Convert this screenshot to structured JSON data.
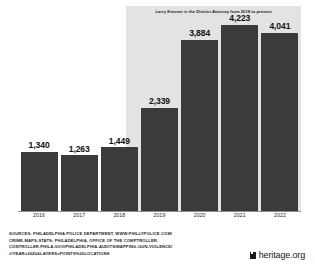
{
  "chart_data": {
    "type": "bar",
    "title": "",
    "subtitle": "",
    "xlabel": "",
    "ylabel": "",
    "categories": [
      "2016",
      "2017",
      "2018",
      "2019",
      "2020",
      "2021",
      "2022"
    ],
    "values": [
      1340,
      1263,
      1449,
      2339,
      3884,
      4223,
      4041
    ],
    "value_labels": [
      "1,340",
      "1,263",
      "1,449",
      "2,339",
      "3,884",
      "4,223",
      "4,041"
    ],
    "ylim": [
      0,
      4650
    ],
    "grid": false,
    "legend": null,
    "bar_color": "#3b3b3b",
    "annotations": [
      {
        "text": "Larry Krasner is the District Attorney from 2018 to present",
        "from_category": "2018",
        "to_category": "2022",
        "shaded_region_color": "#e3e3e3"
      }
    ]
  },
  "footer": {
    "sources_lines": [
      "SOURCES: PHILADELPHIA POLICE DEPARTMENT, WWW.PHILLYPOLICE.COM/",
      "CRIME-MAPS-STATS; PHILADELPHIA, OFFICE OF THE COMPTROLLER,",
      "CONTROLLER.PHILA.GOV/PHILADELPHIA-AUDITS/MAPPING-GUN-VIOLENCE/",
      "#/YEAR=2020&LAYERS=POINTS%20LOCATIONS"
    ],
    "brand_name": "heritage.org",
    "brand_icon": "heritage-logo-mark"
  }
}
